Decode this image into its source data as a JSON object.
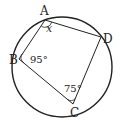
{
  "diagram": {
    "type": "cyclic-quadrilateral-inscribed-in-circle",
    "colors": {
      "stroke": "#222222",
      "background": "#ffffff"
    },
    "circle": {
      "cx": 62,
      "cy": 67,
      "r": 50
    },
    "vertices": [
      {
        "name": "A",
        "label": "A",
        "x": 45,
        "y": 20,
        "label_x": 40,
        "label_y": 15
      },
      {
        "name": "D",
        "label": "D",
        "x": 101,
        "y": 37,
        "label_x": 103,
        "label_y": 43
      },
      {
        "name": "C",
        "label": "C",
        "x": 73,
        "y": 104,
        "label_x": 70,
        "label_y": 117
      },
      {
        "name": "B",
        "label": "B",
        "x": 19,
        "y": 59,
        "label_x": 9,
        "label_y": 64
      }
    ],
    "angles": [
      {
        "vertex": "A",
        "label": "x",
        "x": 46,
        "y": 32
      },
      {
        "vertex": "B",
        "label": "95°",
        "x": 30,
        "y": 63
      },
      {
        "vertex": "C",
        "label": "75°",
        "x": 64,
        "y": 92
      }
    ]
  }
}
